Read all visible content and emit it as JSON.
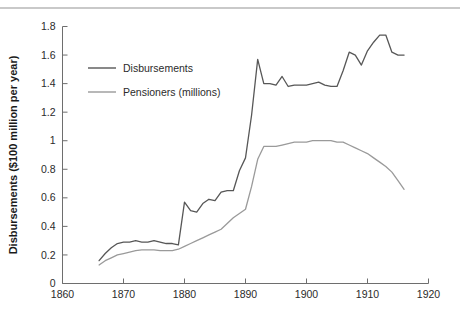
{
  "figure": {
    "top_rule_color": "#c9c9c9",
    "background": "#ffffff"
  },
  "chart_data": {
    "type": "line",
    "title": "",
    "subtitle": "",
    "xlabel": "",
    "ylabel": "Disbursements ($100 million per year)",
    "xlim": [
      1860,
      1920
    ],
    "ylim": [
      0,
      1.8
    ],
    "xticks": [
      1860,
      1870,
      1880,
      1890,
      1900,
      1910,
      1920
    ],
    "xtick_labels": [
      "1860",
      "1870",
      "1880",
      "1890",
      "1900",
      "1910",
      "1920"
    ],
    "yticks": [
      0,
      0.2,
      0.4,
      0.6,
      0.8,
      1.0,
      1.2,
      1.4,
      1.6,
      1.8
    ],
    "ytick_labels": [
      "0",
      "0.2",
      "0.4",
      "0.6",
      "0.8",
      "1",
      "1.2",
      "1.4",
      "1.6",
      "1.8"
    ],
    "grid": false,
    "legend_position": "upper-left-inside",
    "series": [
      {
        "name": "Disbursements",
        "color": "#575757",
        "x": [
          1866,
          1867,
          1868,
          1869,
          1870,
          1871,
          1872,
          1873,
          1874,
          1875,
          1876,
          1877,
          1878,
          1879,
          1880,
          1881,
          1882,
          1883,
          1884,
          1885,
          1886,
          1887,
          1888,
          1889,
          1890,
          1891,
          1892,
          1893,
          1894,
          1895,
          1896,
          1897,
          1898,
          1899,
          1900,
          1901,
          1902,
          1903,
          1904,
          1905,
          1906,
          1907,
          1908,
          1909,
          1910,
          1911,
          1912,
          1913,
          1914,
          1915,
          1916
        ],
        "y": [
          0.16,
          0.21,
          0.25,
          0.28,
          0.29,
          0.29,
          0.3,
          0.29,
          0.29,
          0.3,
          0.29,
          0.28,
          0.28,
          0.27,
          0.57,
          0.51,
          0.5,
          0.56,
          0.59,
          0.58,
          0.64,
          0.65,
          0.65,
          0.79,
          0.88,
          1.18,
          1.57,
          1.4,
          1.4,
          1.39,
          1.45,
          1.38,
          1.39,
          1.39,
          1.39,
          1.4,
          1.41,
          1.39,
          1.38,
          1.38,
          1.49,
          1.62,
          1.6,
          1.53,
          1.63,
          1.69,
          1.74,
          1.74,
          1.62,
          1.6,
          1.6
        ]
      },
      {
        "name": "Pensioners (millions)",
        "color": "#9a9a9a",
        "x": [
          1866,
          1867,
          1868,
          1869,
          1870,
          1871,
          1872,
          1873,
          1874,
          1875,
          1876,
          1877,
          1878,
          1879,
          1880,
          1881,
          1882,
          1883,
          1884,
          1885,
          1886,
          1887,
          1888,
          1889,
          1890,
          1891,
          1892,
          1893,
          1894,
          1895,
          1896,
          1897,
          1898,
          1899,
          1900,
          1901,
          1902,
          1903,
          1904,
          1905,
          1906,
          1907,
          1908,
          1909,
          1910,
          1911,
          1912,
          1913,
          1914,
          1915,
          1916
        ],
        "y": [
          0.13,
          0.16,
          0.18,
          0.2,
          0.21,
          0.22,
          0.23,
          0.235,
          0.235,
          0.235,
          0.23,
          0.23,
          0.23,
          0.24,
          0.26,
          0.28,
          0.3,
          0.32,
          0.34,
          0.36,
          0.38,
          0.42,
          0.46,
          0.49,
          0.52,
          0.68,
          0.87,
          0.96,
          0.96,
          0.96,
          0.97,
          0.98,
          0.99,
          0.99,
          0.99,
          1.0,
          1.0,
          1.0,
          1.0,
          0.99,
          0.99,
          0.97,
          0.95,
          0.93,
          0.91,
          0.88,
          0.85,
          0.82,
          0.78,
          0.72,
          0.66
        ]
      }
    ]
  },
  "legend": {
    "entries": [
      {
        "label": "Disbursements",
        "color": "#575757"
      },
      {
        "label": "Pensioners (millions)",
        "color": "#9a9a9a"
      }
    ]
  }
}
